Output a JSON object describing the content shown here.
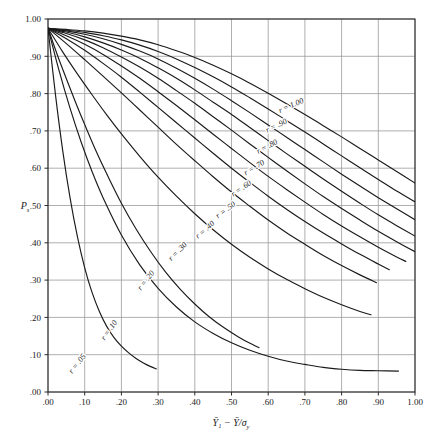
{
  "figure": {
    "background_color": "#ffffff",
    "plot_frame_color": "#2b2b2b",
    "grid_color": "#9a9a9a",
    "curve_color": "#1a1a1a"
  },
  "axes": {
    "y_axis_label": "P",
    "y_axis_label_sub": "s",
    "x_axis_label_main": "Ȳ₁ − Ȳ/σ",
    "x_axis_label_sub": "y",
    "x_ticks": [
      ".00",
      ".10",
      ".20",
      ".30",
      ".40",
      ".50",
      ".60",
      ".70",
      ".80",
      ".90",
      "1.00"
    ],
    "y_ticks": [
      "1.00",
      ".90",
      ".80",
      ".70",
      ".60",
      ".50",
      ".40",
      ".30",
      ".20",
      ".10",
      ".00"
    ],
    "x_tick_values": [
      0.0,
      0.1,
      0.2,
      0.3,
      0.4,
      0.5,
      0.6,
      0.7,
      0.8,
      0.9,
      1.0
    ],
    "y_tick_values": [
      1.0,
      0.9,
      0.8,
      0.7,
      0.6,
      0.5,
      0.4,
      0.3,
      0.2,
      0.1,
      0.0
    ]
  },
  "chart_data": {
    "type": "line",
    "title": "",
    "subtitle": "",
    "xlabel": "Ȳ₁ − Ȳ/σy",
    "ylabel": "Ps",
    "xlim": [
      0.0,
      1.0
    ],
    "ylim": [
      0.0,
      1.0
    ],
    "grid": true,
    "legend": "inline-curve-labels",
    "series": [
      {
        "name": "r = 1.00",
        "label": "r = 1.00",
        "r": 1.0,
        "label_x": 0.665,
        "label_y": 0.762,
        "label_rotation": -24,
        "points": [
          [
            0.0,
            0.975
          ],
          [
            0.05,
            0.972
          ],
          [
            0.1,
            0.968
          ],
          [
            0.15,
            0.962
          ],
          [
            0.2,
            0.954
          ],
          [
            0.25,
            0.944
          ],
          [
            0.3,
            0.931
          ],
          [
            0.35,
            0.915
          ],
          [
            0.4,
            0.897
          ],
          [
            0.45,
            0.876
          ],
          [
            0.5,
            0.853
          ],
          [
            0.55,
            0.828
          ],
          [
            0.6,
            0.801
          ],
          [
            0.65,
            0.773
          ],
          [
            0.7,
            0.744
          ],
          [
            0.75,
            0.714
          ],
          [
            0.8,
            0.684
          ],
          [
            0.85,
            0.653
          ],
          [
            0.9,
            0.622
          ],
          [
            0.95,
            0.591
          ],
          [
            1.0,
            0.56
          ]
        ]
      },
      {
        "name": "r = .90",
        "label": "r = .90",
        "r": 0.9,
        "label_x": 0.625,
        "label_y": 0.708,
        "label_rotation": -26,
        "points": [
          [
            0.0,
            0.975
          ],
          [
            0.05,
            0.97
          ],
          [
            0.1,
            0.964
          ],
          [
            0.15,
            0.955
          ],
          [
            0.2,
            0.944
          ],
          [
            0.25,
            0.93
          ],
          [
            0.3,
            0.913
          ],
          [
            0.35,
            0.893
          ],
          [
            0.4,
            0.87
          ],
          [
            0.45,
            0.845
          ],
          [
            0.5,
            0.818
          ],
          [
            0.55,
            0.789
          ],
          [
            0.6,
            0.759
          ],
          [
            0.65,
            0.728
          ],
          [
            0.7,
            0.697
          ],
          [
            0.75,
            0.665
          ],
          [
            0.8,
            0.633
          ],
          [
            0.85,
            0.601
          ],
          [
            0.9,
            0.57
          ],
          [
            0.95,
            0.539
          ],
          [
            1.0,
            0.51
          ]
        ]
      },
      {
        "name": "r = .80",
        "label": "r = .80",
        "r": 0.8,
        "label_x": 0.6,
        "label_y": 0.652,
        "label_rotation": -28,
        "points": [
          [
            0.0,
            0.975
          ],
          [
            0.05,
            0.968
          ],
          [
            0.1,
            0.959
          ],
          [
            0.15,
            0.947
          ],
          [
            0.2,
            0.932
          ],
          [
            0.25,
            0.914
          ],
          [
            0.3,
            0.893
          ],
          [
            0.35,
            0.868
          ],
          [
            0.4,
            0.841
          ],
          [
            0.45,
            0.812
          ],
          [
            0.5,
            0.781
          ],
          [
            0.55,
            0.749
          ],
          [
            0.6,
            0.716
          ],
          [
            0.65,
            0.683
          ],
          [
            0.7,
            0.65
          ],
          [
            0.75,
            0.617
          ],
          [
            0.8,
            0.584
          ],
          [
            0.85,
            0.552
          ],
          [
            0.9,
            0.521
          ],
          [
            0.95,
            0.491
          ],
          [
            1.0,
            0.462
          ]
        ]
      },
      {
        "name": "r = .70",
        "label": "r = .70",
        "r": 0.7,
        "label_x": 0.565,
        "label_y": 0.596,
        "label_rotation": -31,
        "points": [
          [
            0.0,
            0.975
          ],
          [
            0.05,
            0.965
          ],
          [
            0.1,
            0.952
          ],
          [
            0.15,
            0.936
          ],
          [
            0.2,
            0.917
          ],
          [
            0.25,
            0.895
          ],
          [
            0.3,
            0.869
          ],
          [
            0.35,
            0.841
          ],
          [
            0.4,
            0.81
          ],
          [
            0.45,
            0.777
          ],
          [
            0.5,
            0.744
          ],
          [
            0.55,
            0.709
          ],
          [
            0.6,
            0.674
          ],
          [
            0.65,
            0.639
          ],
          [
            0.7,
            0.605
          ],
          [
            0.75,
            0.571
          ],
          [
            0.8,
            0.538
          ],
          [
            0.85,
            0.506
          ],
          [
            0.9,
            0.475
          ],
          [
            0.95,
            0.446
          ],
          [
            1.0,
            0.418
          ]
        ]
      },
      {
        "name": "r = .60",
        "label": "r = .60",
        "r": 0.6,
        "label_x": 0.53,
        "label_y": 0.54,
        "label_rotation": -34,
        "points": [
          [
            0.0,
            0.975
          ],
          [
            0.05,
            0.961
          ],
          [
            0.1,
            0.944
          ],
          [
            0.15,
            0.923
          ],
          [
            0.2,
            0.898
          ],
          [
            0.25,
            0.871
          ],
          [
            0.3,
            0.841
          ],
          [
            0.35,
            0.808
          ],
          [
            0.4,
            0.774
          ],
          [
            0.45,
            0.738
          ],
          [
            0.5,
            0.702
          ],
          [
            0.55,
            0.665
          ],
          [
            0.6,
            0.629
          ],
          [
            0.65,
            0.593
          ],
          [
            0.7,
            0.558
          ],
          [
            0.75,
            0.524
          ],
          [
            0.8,
            0.492
          ],
          [
            0.85,
            0.461
          ],
          [
            0.9,
            0.431
          ],
          [
            0.95,
            0.403
          ],
          [
            1.0,
            0.376
          ]
        ]
      },
      {
        "name": "r = .50",
        "label": "r = .50",
        "r": 0.5,
        "label_x": 0.488,
        "label_y": 0.483,
        "label_rotation": -37,
        "points": [
          [
            0.0,
            0.975
          ],
          [
            0.05,
            0.955
          ],
          [
            0.1,
            0.932
          ],
          [
            0.15,
            0.905
          ],
          [
            0.2,
            0.874
          ],
          [
            0.25,
            0.841
          ],
          [
            0.3,
            0.805
          ],
          [
            0.35,
            0.768
          ],
          [
            0.4,
            0.73
          ],
          [
            0.45,
            0.691
          ],
          [
            0.5,
            0.653
          ],
          [
            0.55,
            0.615
          ],
          [
            0.6,
            0.578
          ],
          [
            0.65,
            0.543
          ],
          [
            0.7,
            0.509
          ],
          [
            0.75,
            0.476
          ],
          [
            0.8,
            0.445
          ],
          [
            0.85,
            0.416
          ],
          [
            0.9,
            0.388
          ],
          [
            0.95,
            0.362
          ],
          [
            0.975,
            0.35
          ]
        ]
      },
      {
        "name": "r = .40",
        "label": "r = .40",
        "r": 0.4,
        "label_x": 0.432,
        "label_y": 0.43,
        "label_rotation": -41,
        "points": [
          [
            0.0,
            0.975
          ],
          [
            0.05,
            0.947
          ],
          [
            0.1,
            0.916
          ],
          [
            0.15,
            0.881
          ],
          [
            0.2,
            0.844
          ],
          [
            0.25,
            0.804
          ],
          [
            0.3,
            0.763
          ],
          [
            0.35,
            0.722
          ],
          [
            0.4,
            0.681
          ],
          [
            0.45,
            0.64
          ],
          [
            0.5,
            0.6
          ],
          [
            0.55,
            0.562
          ],
          [
            0.6,
            0.525
          ],
          [
            0.65,
            0.49
          ],
          [
            0.7,
            0.457
          ],
          [
            0.75,
            0.426
          ],
          [
            0.8,
            0.397
          ],
          [
            0.85,
            0.369
          ],
          [
            0.9,
            0.343
          ],
          [
            0.93,
            0.328
          ]
        ]
      },
      {
        "name": "r = .30",
        "label": "r = .30",
        "r": 0.3,
        "label_x": 0.358,
        "label_y": 0.372,
        "label_rotation": -46,
        "points": [
          [
            0.0,
            0.975
          ],
          [
            0.05,
            0.934
          ],
          [
            0.1,
            0.891
          ],
          [
            0.15,
            0.847
          ],
          [
            0.2,
            0.802
          ],
          [
            0.25,
            0.756
          ],
          [
            0.3,
            0.71
          ],
          [
            0.35,
            0.664
          ],
          [
            0.4,
            0.62
          ],
          [
            0.45,
            0.577
          ],
          [
            0.5,
            0.536
          ],
          [
            0.55,
            0.498
          ],
          [
            0.6,
            0.461
          ],
          [
            0.65,
            0.427
          ],
          [
            0.7,
            0.396
          ],
          [
            0.75,
            0.366
          ],
          [
            0.8,
            0.339
          ],
          [
            0.85,
            0.314
          ],
          [
            0.895,
            0.293
          ]
        ]
      },
      {
        "name": "r = .20",
        "label": "r = .20",
        "r": 0.2,
        "label_x": 0.272,
        "label_y": 0.295,
        "label_rotation": -52,
        "points": [
          [
            0.0,
            0.975
          ],
          [
            0.04,
            0.912
          ],
          [
            0.08,
            0.853
          ],
          [
            0.12,
            0.797
          ],
          [
            0.16,
            0.743
          ],
          [
            0.2,
            0.692
          ],
          [
            0.25,
            0.632
          ],
          [
            0.3,
            0.576
          ],
          [
            0.35,
            0.525
          ],
          [
            0.4,
            0.478
          ],
          [
            0.45,
            0.435
          ],
          [
            0.5,
            0.396
          ],
          [
            0.55,
            0.361
          ],
          [
            0.6,
            0.33
          ],
          [
            0.65,
            0.302
          ],
          [
            0.7,
            0.277
          ],
          [
            0.75,
            0.254
          ],
          [
            0.8,
            0.234
          ],
          [
            0.85,
            0.216
          ],
          [
            0.88,
            0.207
          ]
        ]
      },
      {
        "name": "r = .10",
        "label": "r = .10",
        "r": 0.1,
        "label_x": 0.172,
        "label_y": 0.162,
        "label_rotation": -55,
        "points": [
          [
            0.0,
            0.975
          ],
          [
            0.03,
            0.862
          ],
          [
            0.06,
            0.761
          ],
          [
            0.09,
            0.671
          ],
          [
            0.12,
            0.591
          ],
          [
            0.15,
            0.521
          ],
          [
            0.2,
            0.421
          ],
          [
            0.25,
            0.341
          ],
          [
            0.3,
            0.278
          ],
          [
            0.35,
            0.228
          ],
          [
            0.4,
            0.188
          ],
          [
            0.45,
            0.157
          ],
          [
            0.5,
            0.132
          ],
          [
            0.55,
            0.112
          ],
          [
            0.6,
            0.096
          ],
          [
            0.65,
            0.083
          ],
          [
            0.7,
            0.074
          ],
          [
            0.75,
            0.066
          ],
          [
            0.8,
            0.061
          ],
          [
            0.85,
            0.058
          ],
          [
            0.9,
            0.057
          ],
          [
            0.955,
            0.056
          ]
        ]
      },
      {
        "name": "r = .05",
        "label": "r = .05",
        "r": 0.05,
        "label_x": 0.085,
        "label_y": 0.072,
        "label_rotation": -52,
        "points": [
          [
            0.0,
            0.975
          ],
          [
            0.02,
            0.8
          ],
          [
            0.04,
            0.648
          ],
          [
            0.06,
            0.521
          ],
          [
            0.08,
            0.417
          ],
          [
            0.1,
            0.333
          ],
          [
            0.12,
            0.267
          ],
          [
            0.14,
            0.216
          ],
          [
            0.16,
            0.176
          ],
          [
            0.18,
            0.146
          ],
          [
            0.2,
            0.123
          ],
          [
            0.22,
            0.105
          ],
          [
            0.24,
            0.09
          ],
          [
            0.26,
            0.078
          ],
          [
            0.28,
            0.068
          ],
          [
            0.295,
            0.062
          ]
        ]
      },
      {
        "name": "r = .05-tail",
        "label": "",
        "r": 0.05,
        "label_x": null,
        "label_y": null,
        "label_rotation": 0,
        "points": [
          [
            0.0,
            0.975
          ],
          [
            0.025,
            0.905
          ],
          [
            0.05,
            0.84
          ],
          [
            0.075,
            0.777
          ],
          [
            0.1,
            0.717
          ],
          [
            0.13,
            0.648
          ],
          [
            0.16,
            0.585
          ],
          [
            0.2,
            0.506
          ],
          [
            0.24,
            0.437
          ],
          [
            0.28,
            0.376
          ],
          [
            0.32,
            0.322
          ],
          [
            0.36,
            0.276
          ],
          [
            0.4,
            0.236
          ],
          [
            0.44,
            0.201
          ],
          [
            0.48,
            0.172
          ],
          [
            0.52,
            0.147
          ],
          [
            0.56,
            0.126
          ],
          [
            0.575,
            0.119
          ]
        ]
      }
    ]
  }
}
